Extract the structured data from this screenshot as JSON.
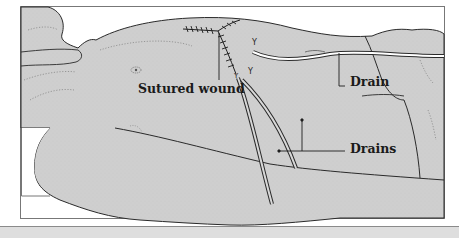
{
  "figure": {
    "type": "medical-illustration",
    "labels": {
      "sutured_wound": "Sutured wound",
      "drain": "Drain",
      "drains": "Drains"
    },
    "colors": {
      "skin_fill": "#cfcfcf",
      "outline": "#2a2a2a",
      "frame": "#777777",
      "background": "#ffffff",
      "bottom_band": "#dedede"
    }
  }
}
